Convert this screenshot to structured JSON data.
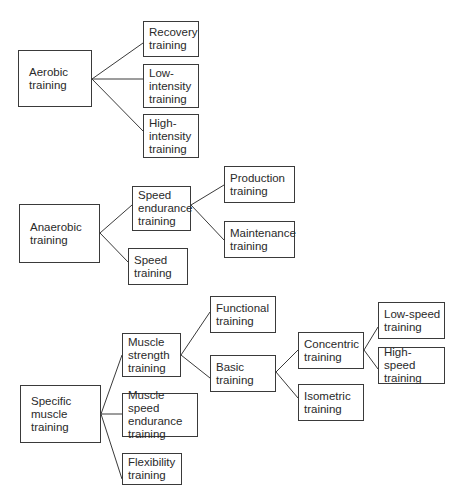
{
  "diagram": {
    "type": "tree",
    "nodes": {
      "aerobic": {
        "label": "Aerobic\ntraining",
        "box": [
          18,
          50,
          74,
          57
        ]
      },
      "recovery": {
        "label": "Recovery\ntraining",
        "box": [
          143,
          21,
          56,
          36
        ]
      },
      "low_intensity": {
        "label": "Low-\nintensity\ntraining",
        "box": [
          143,
          64,
          56,
          44
        ]
      },
      "high_intensity": {
        "label": "High-\nintensity\ntraining",
        "box": [
          143,
          114,
          56,
          44
        ]
      },
      "anaerobic": {
        "label": "Anaerobic\ntraining",
        "box": [
          19,
          204,
          81,
          59
        ]
      },
      "speed_endurance": {
        "label": "Speed\nendurance\ntraining",
        "box": [
          132,
          186,
          59,
          45
        ]
      },
      "speed": {
        "label": "Speed\ntraining",
        "box": [
          128,
          248,
          60,
          37
        ]
      },
      "production": {
        "label": "Production\ntraining",
        "box": [
          224,
          166,
          71,
          37
        ]
      },
      "maintenance": {
        "label": "Maintenance\ntraining",
        "box": [
          224,
          221,
          71,
          37
        ]
      },
      "specific_muscle": {
        "label": "Specific\nmuscle\ntraining",
        "box": [
          20,
          385,
          81,
          58
        ]
      },
      "muscle_strength": {
        "label": "Muscle\nstrength\ntraining",
        "box": [
          122,
          333,
          59,
          44
        ]
      },
      "muscle_speed_endurance": {
        "label": "Muscle speed\nendurance\ntraining",
        "box": [
          122,
          393,
          76,
          44
        ]
      },
      "flexibility": {
        "label": "Flexibility\ntraining",
        "box": [
          122,
          453,
          60,
          32
        ]
      },
      "functional": {
        "label": "Functional\ntraining",
        "box": [
          210,
          296,
          66,
          37
        ]
      },
      "basic": {
        "label": "Basic\ntraining",
        "box": [
          210,
          355,
          66,
          37
        ]
      },
      "concentric": {
        "label": "Concentric\ntraining",
        "box": [
          298,
          332,
          66,
          37
        ]
      },
      "isometric": {
        "label": "Isometric\ntraining",
        "box": [
          298,
          384,
          66,
          37
        ]
      },
      "low_speed": {
        "label": "Low-speed\ntraining",
        "box": [
          378,
          302,
          67,
          37
        ]
      },
      "high_speed": {
        "label": "High-speed\ntraining",
        "box": [
          378,
          347,
          67,
          37
        ]
      }
    },
    "edges": [
      {
        "from": "aerobic",
        "to": "recovery",
        "x1": 92,
        "y1": 79,
        "x2": 143,
        "y2": 43
      },
      {
        "from": "aerobic",
        "to": "low_intensity",
        "x1": 92,
        "y1": 79,
        "x2": 143,
        "y2": 79
      },
      {
        "from": "aerobic",
        "to": "high_intensity",
        "x1": 92,
        "y1": 79,
        "x2": 143,
        "y2": 131
      },
      {
        "from": "anaerobic",
        "to": "speed_endurance",
        "x1": 100,
        "y1": 233,
        "x2": 132,
        "y2": 205
      },
      {
        "from": "anaerobic",
        "to": "speed",
        "x1": 100,
        "y1": 233,
        "x2": 128,
        "y2": 262
      },
      {
        "from": "speed_endurance",
        "to": "production",
        "x1": 191,
        "y1": 205,
        "x2": 224,
        "y2": 185
      },
      {
        "from": "speed_endurance",
        "to": "maintenance",
        "x1": 191,
        "y1": 205,
        "x2": 224,
        "y2": 240
      },
      {
        "from": "specific_muscle",
        "to": "muscle_strength",
        "x1": 101,
        "y1": 414,
        "x2": 122,
        "y2": 355
      },
      {
        "from": "specific_muscle",
        "to": "muscle_speed_endurance",
        "x1": 101,
        "y1": 414,
        "x2": 122,
        "y2": 414
      },
      {
        "from": "specific_muscle",
        "to": "flexibility",
        "x1": 101,
        "y1": 414,
        "x2": 122,
        "y2": 479
      },
      {
        "from": "muscle_strength",
        "to": "functional",
        "x1": 181,
        "y1": 355,
        "x2": 210,
        "y2": 312
      },
      {
        "from": "muscle_strength",
        "to": "basic",
        "x1": 181,
        "y1": 355,
        "x2": 210,
        "y2": 378
      },
      {
        "from": "basic",
        "to": "concentric",
        "x1": 276,
        "y1": 372,
        "x2": 298,
        "y2": 350
      },
      {
        "from": "basic",
        "to": "isometric",
        "x1": 276,
        "y1": 372,
        "x2": 298,
        "y2": 398
      },
      {
        "from": "concentric",
        "to": "low_speed",
        "x1": 364,
        "y1": 350,
        "x2": 378,
        "y2": 327
      },
      {
        "from": "concentric",
        "to": "high_speed",
        "x1": 364,
        "y1": 350,
        "x2": 378,
        "y2": 369
      }
    ]
  }
}
